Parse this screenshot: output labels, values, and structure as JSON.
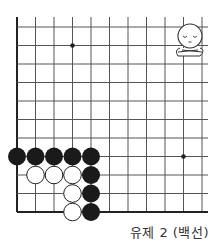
{
  "diagram": {
    "type": "go-board-problem",
    "caption": "유제 2 (백선)",
    "board": {
      "origin_x": 17,
      "origin_y": 212,
      "spacing": 18.5,
      "cols_visible": 11,
      "rows_visible": 11,
      "left_edge": true,
      "bottom_edge": true,
      "star_points": [
        [
          3,
          9
        ],
        [
          9,
          3
        ]
      ],
      "stones": {
        "black": [
          [
            0,
            3
          ],
          [
            1,
            3
          ],
          [
            2,
            3
          ],
          [
            3,
            3
          ],
          [
            4,
            3
          ],
          [
            4,
            2
          ],
          [
            4,
            1
          ],
          [
            4,
            0
          ]
        ],
        "white": [
          [
            1,
            2
          ],
          [
            2,
            2
          ],
          [
            3,
            2
          ],
          [
            3,
            1
          ],
          [
            3,
            0
          ]
        ]
      }
    },
    "character": {
      "icon": "thinking-face-icon",
      "description": "person with closed eyes and crossed arms"
    },
    "colors": {
      "black_stone": "#1a1a1a",
      "white_stone": "#ffffff",
      "line": "#555555",
      "edge": "#222222"
    }
  }
}
